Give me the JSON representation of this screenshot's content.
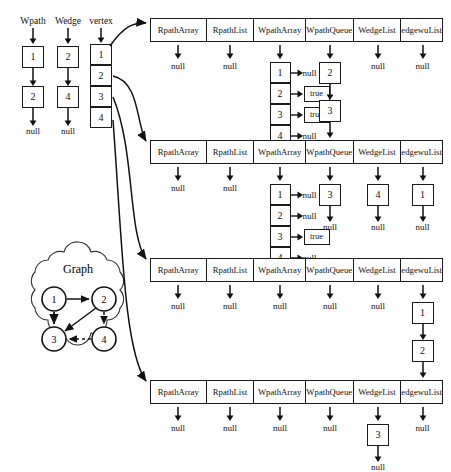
{
  "figure": {
    "background": "#ffffff",
    "ink": "#111111"
  },
  "left_lists": [
    {
      "name": "wpath-list",
      "header": "Wpath",
      "nodes": [
        "1",
        "2"
      ],
      "terminator": "null"
    },
    {
      "name": "wedge-list",
      "header": "Wedge",
      "nodes": [
        "2",
        "4"
      ],
      "terminator": "null"
    }
  ],
  "vertex_array": {
    "header": "vertex",
    "cells": [
      "1",
      "2",
      "3",
      "4"
    ]
  },
  "graph": {
    "title": "Graph",
    "nodes": [
      "1",
      "2",
      "3",
      "4"
    ],
    "edges": [
      {
        "from": "1",
        "to": "2",
        "style": "solid"
      },
      {
        "from": "1",
        "to": "3",
        "style": "solid"
      },
      {
        "from": "2",
        "to": "3",
        "style": "solid"
      },
      {
        "from": "2",
        "to": "4",
        "style": "dashed"
      },
      {
        "from": "4",
        "to": "3",
        "style": "dashed"
      }
    ]
  },
  "table_columns": [
    "RpathArray",
    "RpathList",
    "WpathArray",
    "WpathQueue",
    "WedgeList",
    "edgewuList"
  ],
  "blocks": [
    {
      "name": "vertex-1-block",
      "columns": [
        {
          "column": "RpathArray",
          "kind": "null",
          "value": "null"
        },
        {
          "column": "RpathList",
          "kind": "null",
          "value": "null"
        },
        {
          "column": "WpathArray",
          "kind": "array",
          "rows": [
            {
              "index": "1",
              "value": "null",
              "boxed": false
            },
            {
              "index": "2",
              "value": "true",
              "boxed": true
            },
            {
              "index": "3",
              "value": "true",
              "boxed": true
            },
            {
              "index": "4",
              "value": "null",
              "boxed": false
            }
          ]
        },
        {
          "column": "WpathQueue",
          "kind": "chain",
          "nodes": [
            "2",
            "3"
          ],
          "terminator": "null"
        },
        {
          "column": "WedgeList",
          "kind": "null",
          "value": "null"
        },
        {
          "column": "edgewuList",
          "kind": "null",
          "value": "null"
        }
      ]
    },
    {
      "name": "vertex-2-block",
      "columns": [
        {
          "column": "RpathArray",
          "kind": "null",
          "value": "null"
        },
        {
          "column": "RpathList",
          "kind": "null",
          "value": "null"
        },
        {
          "column": "WpathArray",
          "kind": "array",
          "rows": [
            {
              "index": "1",
              "value": "null",
              "boxed": false
            },
            {
              "index": "2",
              "value": "null",
              "boxed": false
            },
            {
              "index": "3",
              "value": "true",
              "boxed": true
            },
            {
              "index": "4",
              "value": "null",
              "boxed": false
            }
          ]
        },
        {
          "column": "WpathQueue",
          "kind": "chain",
          "nodes": [
            "3"
          ],
          "terminator": "null"
        },
        {
          "column": "WedgeList",
          "kind": "chain",
          "nodes": [
            "4"
          ],
          "terminator": "null"
        },
        {
          "column": "edgewuList",
          "kind": "chain",
          "nodes": [
            "1"
          ],
          "terminator": "null"
        }
      ]
    },
    {
      "name": "vertex-3-block",
      "columns": [
        {
          "column": "RpathArray",
          "kind": "null",
          "value": "null"
        },
        {
          "column": "RpathList",
          "kind": "null",
          "value": "null"
        },
        {
          "column": "WpathArray",
          "kind": "null",
          "value": "null"
        },
        {
          "column": "WpathQueue",
          "kind": "null",
          "value": "null"
        },
        {
          "column": "WedgeList",
          "kind": "null",
          "value": "null"
        },
        {
          "column": "edgewuList",
          "kind": "chain",
          "nodes": [
            "1",
            "2"
          ],
          "terminator": "null"
        }
      ]
    },
    {
      "name": "vertex-4-block",
      "columns": [
        {
          "column": "RpathArray",
          "kind": "null",
          "value": "null"
        },
        {
          "column": "RpathList",
          "kind": "null",
          "value": "null"
        },
        {
          "column": "WpathArray",
          "kind": "null",
          "value": "null"
        },
        {
          "column": "WpathQueue",
          "kind": "null",
          "value": "null"
        },
        {
          "column": "WedgeList",
          "kind": "chain",
          "nodes": [
            "3"
          ],
          "terminator": "null"
        },
        {
          "column": "edgewuList",
          "kind": "null",
          "value": "null"
        }
      ]
    }
  ]
}
